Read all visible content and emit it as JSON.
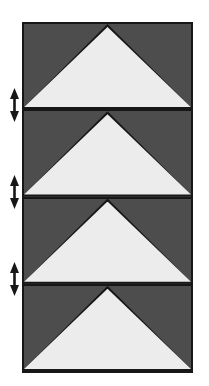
{
  "figure": {
    "colors": {
      "panel_background": "#4d4d4d",
      "triangle_fill": "#ececec",
      "outline": "#171717",
      "page_background": "#ffffff",
      "arrow": "#171717"
    },
    "frame": {
      "x": 22,
      "y": 22,
      "width": 171,
      "height": 351,
      "border_width": 2
    },
    "panels": [
      {
        "index": 1,
        "shape": "triangle",
        "apex": "top-center",
        "base": "bottom-edge"
      },
      {
        "index": 2,
        "shape": "triangle",
        "apex": "top-center",
        "base": "bottom-edge"
      },
      {
        "index": 3,
        "shape": "triangle",
        "apex": "top-center",
        "base": "bottom-edge"
      },
      {
        "index": 4,
        "shape": "triangle",
        "apex": "top-center",
        "base": "bottom-edge"
      }
    ],
    "dimension_arrows": [
      {
        "index": 1,
        "icon": "double-headed-vertical-arrow-icon",
        "aligned_to_divider": 1
      },
      {
        "index": 2,
        "icon": "double-headed-vertical-arrow-icon",
        "aligned_to_divider": 2
      },
      {
        "index": 3,
        "icon": "double-headed-vertical-arrow-icon",
        "aligned_to_divider": 3
      }
    ]
  }
}
